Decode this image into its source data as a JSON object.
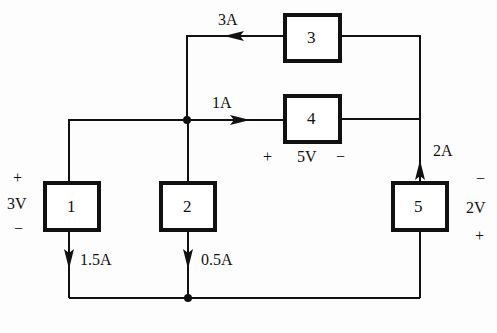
{
  "diagram": {
    "type": "circuit",
    "elements": [
      {
        "id": "1",
        "label": "1",
        "voltage": "3V",
        "polarity_top": "+",
        "polarity_bottom": "−",
        "current": "1.5A",
        "current_direction": "down"
      },
      {
        "id": "2",
        "label": "2",
        "current": "0.5A",
        "current_direction": "down"
      },
      {
        "id": "3",
        "label": "3",
        "current": "3A",
        "current_direction": "left"
      },
      {
        "id": "4",
        "label": "4",
        "voltage": "5V",
        "polarity_left": "+",
        "polarity_right": "−",
        "current": "1A",
        "current_direction": "right"
      },
      {
        "id": "5",
        "label": "5",
        "voltage": "2V",
        "polarity_top": "−",
        "polarity_bottom": "+",
        "current": "2A",
        "current_direction": "up"
      }
    ],
    "colors": {
      "wire": "#111111",
      "background": "#fdfdfd"
    }
  }
}
